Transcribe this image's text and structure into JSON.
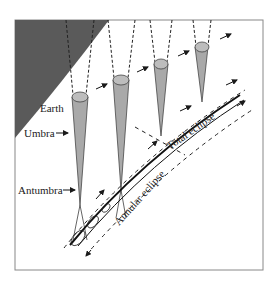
{
  "diagram": {
    "labels": {
      "earth": "Earth",
      "umbra": "Umbra",
      "antumbra": "Antumbra",
      "total_eclipse": "Total eclipse",
      "annular_eclipse": "Annular eclipse"
    },
    "colors": {
      "earth_fill": "#5a5a5a",
      "cone_fill": "#a9a9a9",
      "cone_cap": "#bdbdbd",
      "line": "#1a1a1a",
      "frame": "#888888"
    }
  }
}
